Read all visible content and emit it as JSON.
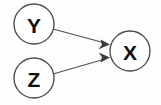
{
  "diagram": {
    "type": "directed-graph",
    "title": "",
    "background_color": "#fdfdfd",
    "node_fill": "#ffffff",
    "node_stroke": "#4a4a4a",
    "edge_color": "#4f4f4f",
    "label_color": "#111111",
    "nodes": [
      {
        "id": "Y",
        "label": "Y",
        "cx": 34,
        "cy": 24,
        "r": 20
      },
      {
        "id": "Z",
        "label": "Z",
        "cx": 34,
        "cy": 78,
        "r": 20
      },
      {
        "id": "X",
        "label": "X",
        "cx": 130,
        "cy": 51,
        "r": 20
      }
    ],
    "edges": [
      {
        "id": "y-to-x",
        "from": "Y",
        "to": "X",
        "label": "",
        "arrow": "to",
        "x1": 53,
        "y1": 29,
        "x2": 110,
        "y2": 44
      },
      {
        "id": "z-to-x",
        "from": "Z",
        "to": "X",
        "label": "",
        "arrow": "to",
        "x1": 53,
        "y1": 74,
        "x2": 110,
        "y2": 58
      }
    ]
  }
}
